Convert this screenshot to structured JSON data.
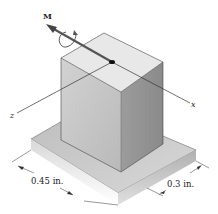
{
  "figure": {
    "moment_label": "M",
    "axis_z_label": "z",
    "axis_x_label": "x",
    "dim_width_label": "0.45 in.",
    "dim_depth_label": "0.3 in."
  },
  "colors": {
    "box_top": "#e6e6e6",
    "box_left": "#c4c4c4",
    "box_right": "#9a9a9a",
    "base_top": "#cfcfcf",
    "base_front_left": "#e9e9e9",
    "base_front_right": "#bdbdbd",
    "lines": "#333333",
    "arrow": "#555555"
  }
}
